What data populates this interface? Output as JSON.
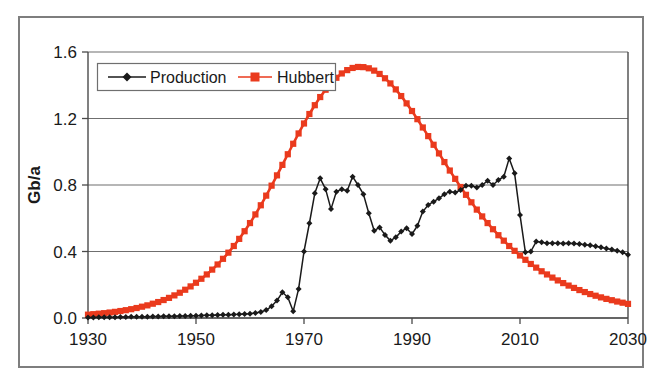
{
  "chart_data": {
    "type": "line",
    "title": "",
    "subtitle": "",
    "xlabel": "",
    "ylabel": "Gb/a",
    "xlim": [
      1930,
      2030
    ],
    "ylim": [
      0.0,
      1.6
    ],
    "xticks": [
      1930,
      1950,
      1970,
      1990,
      2010,
      2030
    ],
    "xtick_labels": [
      "1930",
      "1950",
      "1970",
      "1990",
      "2010",
      "2030"
    ],
    "yticks": [
      0.0,
      0.4,
      0.8,
      1.2,
      1.6
    ],
    "ytick_labels": [
      "0.0",
      "0.4",
      "0.8",
      "1.2",
      "1.6"
    ],
    "grid": "horizontal",
    "legend_position": "top-left-inside",
    "legend_entries": [
      {
        "label": "Production",
        "color": "#1a1a1a",
        "marker": "diamond"
      },
      {
        "label": "Hubbert",
        "color": "#ea3a1d",
        "marker": "square"
      }
    ],
    "x": [
      1930,
      1931,
      1932,
      1933,
      1934,
      1935,
      1936,
      1937,
      1938,
      1939,
      1940,
      1941,
      1942,
      1943,
      1944,
      1945,
      1946,
      1947,
      1948,
      1949,
      1950,
      1951,
      1952,
      1953,
      1954,
      1955,
      1956,
      1957,
      1958,
      1959,
      1960,
      1961,
      1962,
      1963,
      1964,
      1965,
      1966,
      1967,
      1968,
      1969,
      1970,
      1971,
      1972,
      1973,
      1974,
      1975,
      1976,
      1977,
      1978,
      1979,
      1980,
      1981,
      1982,
      1983,
      1984,
      1985,
      1986,
      1987,
      1988,
      1989,
      1990,
      1991,
      1992,
      1993,
      1994,
      1995,
      1996,
      1997,
      1998,
      1999,
      2000,
      2001,
      2002,
      2003,
      2004,
      2005,
      2006,
      2007,
      2008,
      2009,
      2010,
      2011,
      2012,
      2013,
      2014,
      2015,
      2016,
      2017,
      2018,
      2019,
      2020,
      2021,
      2022,
      2023,
      2024,
      2025,
      2026,
      2027,
      2028,
      2029,
      2030
    ],
    "series": [
      {
        "name": "Production",
        "color": "#1a1a1a",
        "marker": "diamond",
        "values": [
          0.003,
          0.003,
          0.004,
          0.004,
          0.005,
          0.005,
          0.006,
          0.006,
          0.007,
          0.007,
          0.008,
          0.008,
          0.009,
          0.009,
          0.01,
          0.01,
          0.011,
          0.012,
          0.012,
          0.013,
          0.014,
          0.015,
          0.016,
          0.017,
          0.018,
          0.019,
          0.02,
          0.021,
          0.022,
          0.024,
          0.026,
          0.03,
          0.036,
          0.048,
          0.07,
          0.105,
          0.155,
          0.125,
          0.04,
          0.175,
          0.4,
          0.57,
          0.75,
          0.84,
          0.775,
          0.655,
          0.76,
          0.775,
          0.765,
          0.85,
          0.8,
          0.745,
          0.63,
          0.525,
          0.545,
          0.5,
          0.465,
          0.485,
          0.52,
          0.54,
          0.505,
          0.555,
          0.64,
          0.68,
          0.7,
          0.72,
          0.745,
          0.76,
          0.755,
          0.77,
          0.795,
          0.795,
          0.785,
          0.8,
          0.825,
          0.8,
          0.83,
          0.85,
          0.96,
          0.87,
          0.62,
          0.395,
          0.4,
          0.46,
          0.455,
          0.45,
          0.45,
          0.45,
          0.448,
          0.45,
          0.448,
          0.445,
          0.44,
          0.438,
          0.432,
          0.425,
          0.418,
          0.412,
          0.405,
          0.395,
          0.38
        ]
      },
      {
        "name": "Hubbert",
        "color": "#ea3a1d",
        "marker": "square",
        "values": [
          0.02,
          0.023,
          0.026,
          0.029,
          0.033,
          0.037,
          0.042,
          0.047,
          0.053,
          0.06,
          0.068,
          0.076,
          0.086,
          0.096,
          0.108,
          0.121,
          0.136,
          0.152,
          0.17,
          0.19,
          0.212,
          0.236,
          0.262,
          0.291,
          0.322,
          0.356,
          0.393,
          0.433,
          0.476,
          0.522,
          0.571,
          0.623,
          0.678,
          0.736,
          0.796,
          0.858,
          0.921,
          0.985,
          1.048,
          1.11,
          1.17,
          1.227,
          1.28,
          1.329,
          1.373,
          1.412,
          1.445,
          1.471,
          1.491,
          1.504,
          1.51,
          1.509,
          1.502,
          1.488,
          1.468,
          1.442,
          1.411,
          1.375,
          1.335,
          1.291,
          1.245,
          1.196,
          1.146,
          1.094,
          1.042,
          0.99,
          0.938,
          0.887,
          0.837,
          0.788,
          0.741,
          0.696,
          0.652,
          0.611,
          0.571,
          0.534,
          0.498,
          0.465,
          0.433,
          0.404,
          0.376,
          0.35,
          0.325,
          0.303,
          0.281,
          0.262,
          0.243,
          0.226,
          0.21,
          0.195,
          0.181,
          0.168,
          0.156,
          0.144,
          0.134,
          0.124,
          0.115,
          0.107,
          0.099,
          0.092,
          0.085
        ]
      }
    ]
  },
  "colors": {
    "hubbert_red": "#ea3a1d",
    "production_black": "#1a1a1a",
    "gridline": "#6f6f6f",
    "frame": "#7e7e7e",
    "background": "#ffffff"
  }
}
